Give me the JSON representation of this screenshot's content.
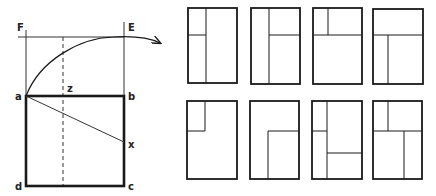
{
  "construction": {
    "labels": {
      "F": "F",
      "E": "E",
      "z": "z",
      "a": "a",
      "b": "b",
      "x": "x",
      "d": "d",
      "c": "c"
    }
  },
  "layouts": {
    "count": 8,
    "rows": 2,
    "columns": 4,
    "items": [
      {
        "index": 1,
        "description": "vertical division at left third; left column split horizontally near top third"
      },
      {
        "index": 2,
        "description": "vertical division at left third; right column split horizontally near top third"
      },
      {
        "index": 3,
        "description": "horizontal division near top third across full width; top band split vertically at left third"
      },
      {
        "index": 4,
        "description": "horizontal division near top third across full width; bottom area split vertically at left third"
      },
      {
        "index": 5,
        "description": "small rectangle in top-left corner"
      },
      {
        "index": 6,
        "description": "rectangle in bottom-right corner"
      },
      {
        "index": 7,
        "description": "vertical division at left third; left column split near top third; right column split horizontally near lower third"
      },
      {
        "index": 8,
        "description": "horizontal division near top third; top band split at left third; bottom area split vertically at right third"
      }
    ]
  },
  "colors": {
    "stroke": "#1a1a1a",
    "background": "#ffffff"
  }
}
